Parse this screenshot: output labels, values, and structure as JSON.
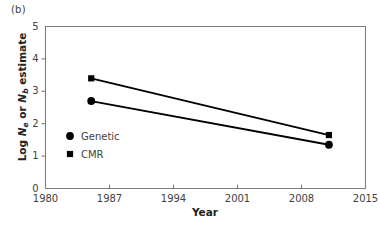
{
  "panel": {
    "label": "(b)"
  },
  "axes": {
    "x_title": "Year",
    "y_title_prefix": "Log ",
    "y_title_n1": "N",
    "y_title_sub1": "e",
    "y_title_mid": " or ",
    "y_title_n2": "N",
    "y_title_sub2": "b",
    "y_title_suffix": " estimate"
  },
  "colors": {
    "marker": "#000000",
    "line": "#000000",
    "axis": "#7d7d7d",
    "text": "#3f3f3f",
    "background": "#ffffff"
  },
  "legend": {
    "entries": [
      {
        "label": "Genetic",
        "marker": "circle"
      },
      {
        "label": "CMR",
        "marker": "square"
      }
    ]
  },
  "chart_data": {
    "type": "line",
    "title": "",
    "subtitle": "",
    "xlabel": "Year",
    "ylabel": "Log Ne or Nb estimate",
    "xlim": [
      1980,
      2015
    ],
    "ylim": [
      0,
      5
    ],
    "xticks": [
      1980,
      1987,
      1994,
      2001,
      2008,
      2015
    ],
    "xticklabels": [
      "1980",
      "1987",
      "1994",
      "2001",
      "2008",
      "2015"
    ],
    "yticks": [
      0,
      1,
      2,
      3,
      4,
      5
    ],
    "yticklabels": [
      "0",
      "1",
      "2",
      "3",
      "4",
      "5"
    ],
    "grid": false,
    "legend_position": "inside-lower-left",
    "series": [
      {
        "name": "CMR",
        "marker": "square",
        "x": [
          1985,
          2011
        ],
        "values": [
          3.4,
          1.65
        ]
      },
      {
        "name": "Genetic",
        "marker": "circle",
        "x": [
          1985,
          2011
        ],
        "values": [
          2.7,
          1.35
        ]
      }
    ]
  }
}
